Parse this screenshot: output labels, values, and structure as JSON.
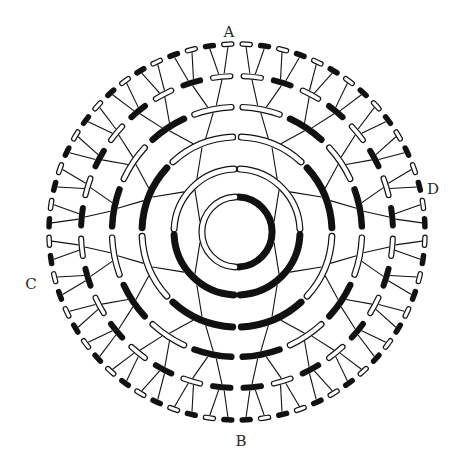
{
  "figure": {
    "type": "circular-binary-tree",
    "levels": 6,
    "segments_per_level": [
      2,
      4,
      8,
      16,
      32,
      64
    ],
    "ring1_colors": {
      "left": "white",
      "right": "black"
    },
    "rule": "Top half: segments alternate white/black starting with white next to the vertical axis; bottom half: alternate starting with black next to the vertical axis; each segment connects to its parent by a line.",
    "colors": {
      "ink": "#111111",
      "paper": "#ffffff"
    }
  },
  "labels": {
    "top": "A",
    "bottom": "B",
    "left": "C",
    "right": "D"
  }
}
